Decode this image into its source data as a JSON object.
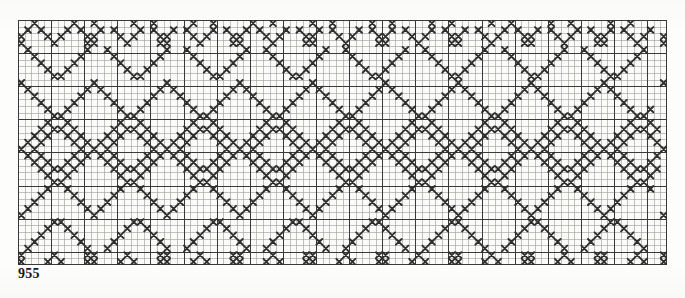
{
  "document": {
    "type": "cross-stitch-pattern-chart",
    "page_label": "955"
  },
  "caption": {
    "text": "955"
  },
  "grid": {
    "columns": 98,
    "rows": 37,
    "cell_px": 6.62,
    "minor_line_color": "#9a9a96",
    "major_line_color": "#3a3a38",
    "major_every": 5,
    "background_color": "#fbfbfa",
    "stitch_color": "#2e2e2c",
    "origin_x": 18,
    "origin_y": 20,
    "width_px": 649,
    "height_px": 245
  },
  "chart_data": {
    "type": "heatmap",
    "title": "955",
    "xlabel": "",
    "ylabel": "",
    "legend": [
      {
        "symbol": "X",
        "label": "cross stitch",
        "color": "#2e2e2c"
      }
    ],
    "repeat_columns": 24,
    "bands": [
      {
        "name": "top-zigzag",
        "rows": [
          0,
          7
        ]
      },
      {
        "name": "centre-diamonds",
        "rows": [
          8,
          29
        ]
      },
      {
        "name": "bottom-zigzag",
        "rows": [
          30,
          36
        ]
      }
    ],
    "cells": [
      "..X.....X..X.....X..X.....X..X.....X..X.....X..X.....X..X.....X..X.....X..X.....X..X.....X..X....",
      ".X.X...X.X..X.X...X.X..X.X...X.X..X.X...X.X..X.X...X.X..X.X...X.X..X.X...X.X..X.X...X.X..X.X...X.",
      "X...X.X...XX...X.X...XX...X.X...XX...X.X...XX...X.X...XX...X.X...XX...X.X...XX...X.X...XX...X.X..",
      "X....X....XX....X....XX....X....XX....X....XX....X....XX....X....XX....X....XX....X....XX....X...",
      ".X........X..X........X..X........X..X........X..X........X..X........X..X........X..X........X..",
      "..X......X....X......X....X......X....X......X....X......X....X......X....X......X....X......X...",
      "...X....X......X....X......X....X......X....X......X....X......X....X......X....X......X....X....",
      "....X..X........X..X........X..X........X..X........X..X........X..X........X..X........X..X.....",
      ".....XX..........XX..........XX..........XX..........XX..........XX..........XX..........XX......",
      "X..........X..........X..........X..........X..........X..........X..........X..........X........",
      ".X........X.X........X.X........X.X........X.X........X.X........X.X........X.X........X.X.......",
      "..X......X...X......X...X......X...X......X...X......X...X......X...X......X...X......X...X......",
      "...X....X.....X....X.....X....X.....X....X.....X....X.....X....X.....X....X.....X....X.....X.....",
      "....X..X.......X..X.......X..X.......X..X.......X..X.......X..X.......X..X.......X..X.......X..X.",
      ".....XX.........XX.........XX.........XX.........XX.........XX.........XX.........XX.........XX..",
      "....X..X.......X..X.......X..X.......X..X.......X..X.......X..X.......X..X.......X..X.......X..X.",
      "...X.XX.X.....X.XX.X.....X.XX.X.....X.XX.X.....X.XX.X.....X.XX.X.....X.XX.X.....X.XX.X.....X.XX.X",
      "..X.X..X.X...X.X..X.X...X.X..X.X...X.X..X.X...X.X..X.X...X.X..X.X...X.X..X.X...X.X..X.X...X.X..X.",
      ".X.X....X.X.X.X....X.X.X.X....X.X.X.X....X.X.X.X....X.X.X.X....X.X.X.X....X.X.X.X....X.X.X.X....X",
      "X.X......X.X.X......X.X.X......X.X.X......X.X.X......X.X.X......X.X.X......X.X.X......X.X.X......",
      ".X.X....X.X.X.X....X.X.X.X....X.X.X.X....X.X.X.X....X.X.X.X....X.X.X.X....X.X.X.X....X.X.X.X....X",
      "..X.X..X.X...X.X..X.X...X.X..X.X...X.X..X.X...X.X..X.X...X.X..X.X...X.X..X.X...X.X..X.X...X.X..X.",
      "...X.XX.X.....X.XX.X.....X.XX.X.....X.XX.X.....X.XX.X.....X.XX.X.....X.XX.X.....X.XX.X.....X.XX.X",
      "....X..X.......X..X.......X..X.......X..X.......X..X.......X..X.......X..X.......X..X.......X..X.",
      ".....XX.........XX.........XX.........XX.........XX.........XX.........XX.........XX.........XX..",
      "....X..X.......X..X.......X..X.......X..X.......X..X.......X..X.......X..X.......X..X.......X..X.",
      "...X....X.....X....X.....X....X.....X....X.....X....X.....X....X.....X....X.....X....X.....X.....",
      "..X......X...X......X...X......X...X......X...X......X...X......X...X......X...X......X...X......",
      ".X........X.X........X.X........X.X........X.X........X.X........X.X........X.X........X.X.......",
      "X..........X..........X..........X..........X..........X..........X..........X..........X........",
      ".....XX..........XX..........XX..........XX..........XX..........XX..........XX..........XX......",
      "....X..X........X..X........X..X........X..X........X..X........X..X........X..X........X..X.....",
      "...X....X......X....X......X....X......X....X......X....X......X....X......X....X......X....X....",
      "..X......X....X......X....X......X....X......X....X......X....X......X....X......X....X......X...",
      ".X........X..X........X..X........X..X........X..X........X..X........X..X........X..X........X..",
      "X....X....XX....X....XX....X....XX....X....XX....X....XX....X....XX....X....XX....X....XX....X...",
      "X...X.X...XX...X.X...XX...X.X...XX...X.X...XX...X.X...XX...X.X...XX...X.X...XX...X.X...XX...X.X.."
    ]
  }
}
